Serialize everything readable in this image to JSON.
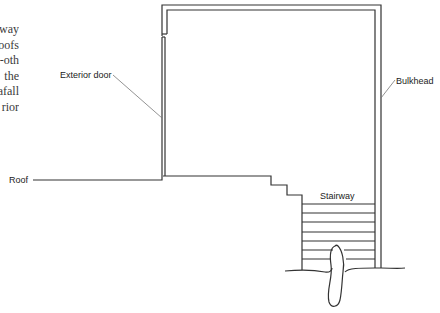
{
  "body_text": {
    "lines": [
      "way",
      "oofs",
      "oth-",
      "the",
      "afall",
      "rior"
    ]
  },
  "diagram": {
    "labels": {
      "exterior_door": "Exterior door",
      "bulkhead": "Bulkhead",
      "roof": "Roof",
      "stairway": "Stairway"
    },
    "colors": {
      "line": "#333333",
      "leader": "#777777",
      "text": "#222222"
    }
  }
}
